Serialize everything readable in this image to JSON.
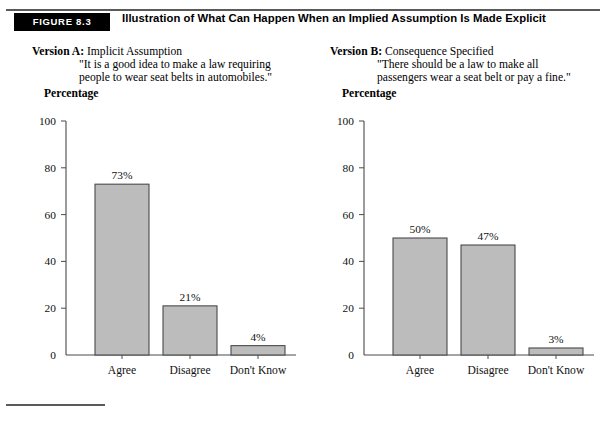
{
  "figure": {
    "badge": "FIGURE 8.3",
    "title": "Illustration of What Can Happen When an Implied Assumption Is Made Explicit"
  },
  "versions": [
    {
      "label": "Version A:",
      "name": "Implicit Assumption",
      "quote_line1": "\"It is a good idea to make a law requiring",
      "quote_line2": "people to wear seat belts in automobiles.\""
    },
    {
      "label": "Version B:",
      "name": "Consequence Specified",
      "quote_line1": "\"There should be a law to make all",
      "quote_line2": "passengers wear a seat belt or pay a fine.\""
    }
  ],
  "footer_rule": true,
  "colors": {
    "bar_fill": "#bcbcbc",
    "bar_stroke": "#4a4a4a",
    "axis": "#4a4a4a",
    "badge_bg": "#000000",
    "badge_text": "#ffffff"
  },
  "chart_data": [
    {
      "type": "bar",
      "id": "version-a",
      "title": "Percentage",
      "xlabel": "",
      "ylabel": "Percentage",
      "categories": [
        "Agree",
        "Disagree",
        "Don't Know"
      ],
      "values": [
        73,
        21,
        4
      ],
      "value_labels": [
        "73%",
        "21%",
        "4%"
      ],
      "yticks": [
        0,
        20,
        40,
        60,
        80,
        100
      ],
      "ytick_labels": [
        "0",
        "20",
        "40",
        "60",
        "80",
        "100"
      ],
      "ylim": [
        0,
        100
      ],
      "grid": false,
      "legend": "none"
    },
    {
      "type": "bar",
      "id": "version-b",
      "title": "Percentage",
      "xlabel": "",
      "ylabel": "Percentage",
      "categories": [
        "Agree",
        "Disagree",
        "Don't Know"
      ],
      "values": [
        50,
        47,
        3
      ],
      "value_labels": [
        "50%",
        "47%",
        "3%"
      ],
      "yticks": [
        0,
        20,
        40,
        60,
        80,
        100
      ],
      "ytick_labels": [
        "0",
        "20",
        "40",
        "60",
        "80",
        "100"
      ],
      "ylim": [
        0,
        100
      ],
      "grid": false,
      "legend": "none"
    }
  ]
}
